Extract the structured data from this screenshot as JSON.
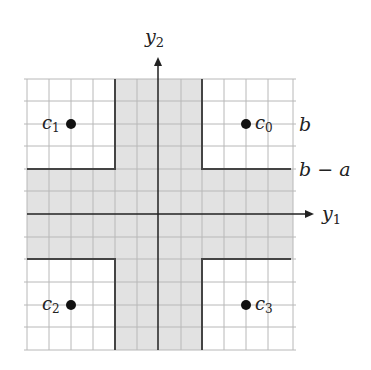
{
  "diagram": {
    "axes": {
      "x_label": "y",
      "x_sub": "1",
      "y_label": "y",
      "y_sub": "2"
    },
    "levels": {
      "upper": "b",
      "lower": "b − a"
    },
    "points": [
      {
        "name": "c",
        "sub": "0",
        "quadrant": "top-right"
      },
      {
        "name": "c",
        "sub": "1",
        "quadrant": "top-left"
      },
      {
        "name": "c",
        "sub": "2",
        "quadrant": "bottom-left"
      },
      {
        "name": "c",
        "sub": "3",
        "quadrant": "bottom-right"
      }
    ],
    "colors": {
      "shade": "#e2e2e2",
      "grid": "#b8b8b8",
      "boundary": "#444444",
      "axis": "#222222"
    }
  }
}
